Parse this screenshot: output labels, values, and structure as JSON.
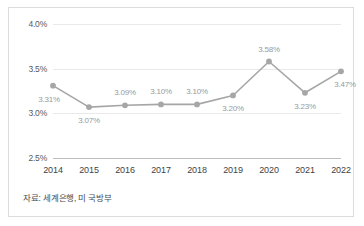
{
  "chart_data": {
    "type": "line",
    "title": "",
    "xlabel": "",
    "ylabel": "",
    "categories": [
      "2014",
      "2015",
      "2016",
      "2017",
      "2018",
      "2019",
      "2020",
      "2021",
      "2022"
    ],
    "values": [
      3.31,
      3.07,
      3.09,
      3.1,
      3.1,
      3.2,
      3.58,
      3.23,
      3.47
    ],
    "point_labels": [
      "3.31%",
      "3.07%",
      "3.09%",
      "3.10%",
      "3.10%",
      "3.20%",
      "3.58%",
      "3.23%",
      "3.47%"
    ],
    "label_positions": [
      "below-left",
      "below",
      "above",
      "above",
      "above",
      "below",
      "above",
      "below",
      "below-right"
    ],
    "ylim": [
      2.5,
      4.0
    ],
    "ytick_values": [
      2.5,
      3.0,
      3.5,
      4.0
    ],
    "ytick_labels": [
      "2.5%",
      "3.0%",
      "3.5%",
      "4.0%"
    ],
    "grid": true,
    "legend": "none",
    "series_color": "#a6a6a6",
    "marker_color": "#a6a6a6",
    "gridline_color": "#e9e9e9",
    "baseline_color": "#bdbdbd",
    "label_color": "#9a9a9a"
  },
  "footer": {
    "source_text": "자료: 세계은행, 미 국방부"
  }
}
